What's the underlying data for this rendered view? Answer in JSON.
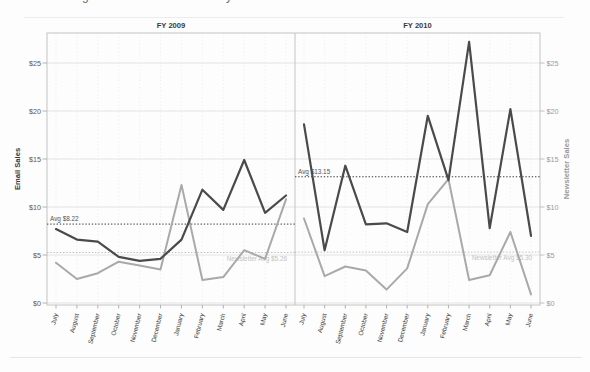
{
  "page": {
    "background": "#fdfdfd",
    "cropped_title_fragments": [
      "g",
      "y"
    ]
  },
  "chart_data": {
    "type": "line",
    "categories": [
      "July",
      "August",
      "September",
      "October",
      "November",
      "December",
      "January",
      "February",
      "March",
      "April",
      "May",
      "June"
    ],
    "xlabel": "",
    "left_axis": {
      "title": "Email Sales",
      "tick_values": [
        0,
        5,
        10,
        15,
        20,
        25
      ],
      "tick_labels": [
        "$0",
        "$5",
        "$10",
        "$15",
        "$20",
        "$25"
      ],
      "range": [
        0,
        28
      ]
    },
    "right_axis": {
      "title": "Newsletter Sales",
      "tick_values": [
        0,
        5,
        10,
        15,
        20,
        25
      ],
      "tick_labels": [
        "$0",
        "$5",
        "$10",
        "$15",
        "$20",
        "$25"
      ],
      "range": [
        0,
        28
      ]
    },
    "grid": true,
    "legend": "none",
    "colors": {
      "email_line": "#4a4a4a",
      "newsletter_line": "#a9a9a9",
      "email_avg_line": "#3c3c3c",
      "newsletter_avg_line": "#bdbdbd",
      "gridline": "#e3e3e3",
      "panel_border": "#c4c4c4",
      "title_text": "#3a3a3a",
      "right_axis_text": "#9a9a9a"
    },
    "panels": [
      {
        "title": "FY 2009",
        "series": [
          {
            "name": "Email Sales",
            "role": "email",
            "values": [
              7.7,
              6.6,
              6.4,
              4.8,
              4.4,
              4.6,
              6.6,
              11.8,
              9.7,
              14.9,
              9.4,
              11.2
            ]
          },
          {
            "name": "Newsletter Sales",
            "role": "newsletter",
            "values": [
              4.2,
              2.5,
              3.1,
              4.3,
              3.9,
              3.5,
              12.3,
              2.4,
              2.7,
              5.5,
              4.6,
              10.8
            ]
          }
        ],
        "ref_lines": [
          {
            "label": "Avg $8.22",
            "value": 8.22,
            "role": "email",
            "label_side": "left"
          },
          {
            "label": "Newsletter Avg $5.26",
            "value": 5.26,
            "role": "newsletter",
            "label_side": "right"
          }
        ]
      },
      {
        "title": "FY 2010",
        "series": [
          {
            "name": "Email Sales",
            "role": "email",
            "values": [
              18.6,
              5.5,
              14.3,
              8.2,
              8.3,
              7.4,
              19.5,
              12.8,
              27.2,
              7.8,
              20.2,
              7.0
            ]
          },
          {
            "name": "Newsletter Sales",
            "role": "newsletter",
            "values": [
              8.8,
              2.8,
              3.8,
              3.4,
              1.4,
              3.6,
              10.3,
              12.9,
              2.4,
              2.9,
              7.4,
              0.9
            ]
          }
        ],
        "ref_lines": [
          {
            "label": "Avg $13.15",
            "value": 13.15,
            "role": "email",
            "label_side": "left"
          },
          {
            "label": "Newsletter Avg $5.30",
            "value": 5.3,
            "role": "newsletter",
            "label_side": "right"
          }
        ]
      }
    ]
  }
}
